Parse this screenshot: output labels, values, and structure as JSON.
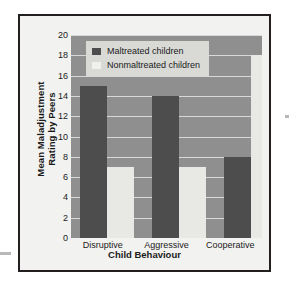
{
  "chart_data": {
    "type": "bar",
    "title": "",
    "xlabel": "Child Behaviour",
    "ylabel_line1": "Mean Maladjustment",
    "ylabel_line2": "Rating by Peers",
    "ylabel": "Mean Maladjustment Rating by Peers",
    "categories": [
      "Disruptive",
      "Aggressive",
      "Cooperative"
    ],
    "series": [
      {
        "name": "Maltreated children",
        "values": [
          15,
          14,
          8
        ],
        "color": "#4d4d4d"
      },
      {
        "name": "Nonmaltreated children",
        "values": [
          7,
          7,
          18
        ],
        "color": "#e8e8e4"
      }
    ],
    "ylim": [
      0,
      20
    ],
    "ytick_values": [
      20,
      18,
      16,
      14,
      12,
      10,
      8,
      6,
      4,
      2,
      0
    ],
    "yticks": [
      "20",
      "18",
      "16",
      "14",
      "12",
      "10",
      "8",
      "6",
      "4",
      "2",
      "0"
    ],
    "grid": true,
    "legend_position": "upper-left-inside",
    "plot_background": "#8f8f8f",
    "page_background": "#f2f2f0"
  }
}
